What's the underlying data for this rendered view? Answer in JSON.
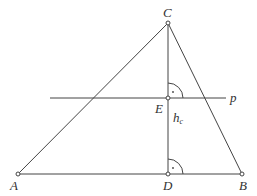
{
  "diagram": {
    "points": {
      "A": {
        "label": "A",
        "x": 18,
        "y": 174
      },
      "B": {
        "label": "B",
        "x": 242,
        "y": 174
      },
      "C": {
        "label": "C",
        "x": 168,
        "y": 23
      },
      "D": {
        "label": "D",
        "x": 168,
        "y": 174
      },
      "E": {
        "label": "E",
        "x": 168,
        "y": 98
      }
    },
    "line_p": {
      "label": "p",
      "x1": 50,
      "x2": 226,
      "y": 98
    },
    "altitude": {
      "label": "h",
      "subscript": "c"
    },
    "right_angle_markers": [
      "at E between EC and line p",
      "at D between DC and DB"
    ]
  }
}
